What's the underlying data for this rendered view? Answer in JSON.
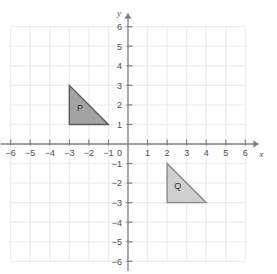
{
  "chart_data": {
    "type": "scatter",
    "title": "",
    "xlabel": "x",
    "ylabel": "y",
    "xlim": [
      -6,
      6
    ],
    "ylim": [
      -6,
      6
    ],
    "grid": true,
    "legend": "none",
    "x_ticks": [
      "−6",
      "−5",
      "−4",
      "−3",
      "−2",
      "−1",
      "1",
      "2",
      "3",
      "4",
      "5",
      "6"
    ],
    "x_tick_values": [
      -6,
      -5,
      -4,
      -3,
      -2,
      -1,
      1,
      2,
      3,
      4,
      5,
      6
    ],
    "y_ticks": [
      "6",
      "5",
      "4",
      "3",
      "2",
      "1",
      "−1",
      "−2",
      "−3",
      "−4",
      "−5",
      "−6"
    ],
    "y_tick_values": [
      6,
      5,
      4,
      3,
      2,
      1,
      -1,
      -2,
      -3,
      -4,
      -5,
      -6
    ],
    "origin_label": "0",
    "shapes": [
      {
        "name": "P",
        "label": "P",
        "vertices": [
          [
            -3,
            3
          ],
          [
            -3,
            1
          ],
          [
            -1,
            1
          ]
        ],
        "label_position": [
          -2.45,
          1.7
        ],
        "fill": "#a3a3a3",
        "stroke": "#5a5a5a"
      },
      {
        "name": "Q",
        "label": "Q",
        "vertices": [
          [
            2,
            -1
          ],
          [
            2,
            -3
          ],
          [
            4,
            -3
          ]
        ],
        "label_position": [
          2.55,
          -2.3
        ],
        "fill": "#cfcfcf",
        "stroke": "#8c8c8c"
      }
    ],
    "colors": {
      "background": "#ffffff",
      "grid": "#ececec",
      "axis": "#808080",
      "tick_text": "#4d4d4d"
    }
  }
}
